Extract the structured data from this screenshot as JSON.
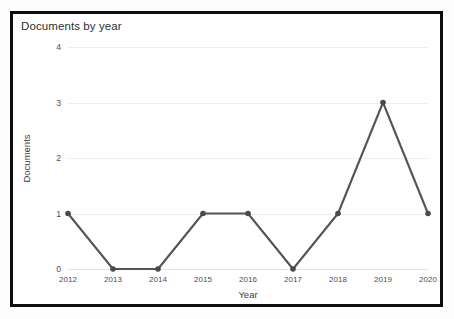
{
  "chart_data": {
    "type": "line",
    "title": "Documents by year",
    "xlabel": "Year",
    "ylabel": "Documents",
    "categories": [
      "2012",
      "2013",
      "2014",
      "2015",
      "2016",
      "2017",
      "2018",
      "2019",
      "2020"
    ],
    "values": [
      1,
      0,
      0,
      1,
      1,
      0,
      1,
      3,
      1
    ],
    "ylim": [
      0,
      4
    ],
    "yticks": [
      "0",
      "1",
      "2",
      "3",
      "4"
    ],
    "ytick_values": [
      0,
      1,
      2,
      3,
      4
    ],
    "grid": true,
    "legend": "none",
    "series_color": "#555555",
    "marker": "circle",
    "marker_color": "#4a4a4a"
  },
  "frame": {
    "border_color": "#0d0d0d",
    "background": "#ffffff"
  }
}
